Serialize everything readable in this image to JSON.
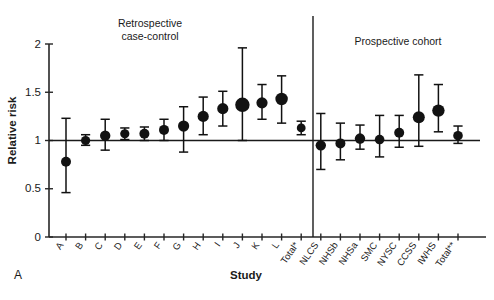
{
  "figure": {
    "panel_letter": "A",
    "axis": {
      "ylabel": "Relative risk",
      "xlabel": "Study",
      "yticks": [
        "0",
        "0.5",
        "1",
        "1.5",
        "2"
      ],
      "ytick_values": [
        0,
        0.5,
        1,
        1.5,
        2
      ],
      "ylim": [
        0,
        2
      ],
      "reference_value": 1
    },
    "groups": [
      {
        "title_line1": "Retrospective",
        "title_line2": "case-control"
      },
      {
        "title_line1": "Prospective cohort",
        "title_line2": ""
      }
    ]
  },
  "chart_data": {
    "type": "scatter",
    "title": "",
    "subtitle": "",
    "xlabel": "Study",
    "ylabel": "Relative risk",
    "ylim": [
      0,
      2
    ],
    "yticks": [
      0,
      0.5,
      1,
      1.5,
      2
    ],
    "grid": false,
    "legend": null,
    "reference_line": 1,
    "annotations": [
      "Retrospective case-control",
      "Prospective cohort"
    ],
    "group_divider_after": "Total*",
    "categories": [
      "A",
      "B",
      "C",
      "D",
      "E",
      "F",
      "G",
      "H",
      "I",
      "J",
      "K",
      "L",
      "Total*",
      "NLCS",
      "NHSb",
      "NHSa",
      "SMC",
      "NYSC",
      "CCSS",
      "IWHS",
      "Total**"
    ],
    "groups": [
      "Retrospective case-control",
      "Retrospective case-control",
      "Retrospective case-control",
      "Retrospective case-control",
      "Retrospective case-control",
      "Retrospective case-control",
      "Retrospective case-control",
      "Retrospective case-control",
      "Retrospective case-control",
      "Retrospective case-control",
      "Retrospective case-control",
      "Retrospective case-control",
      "Retrospective case-control",
      "Prospective cohort",
      "Prospective cohort",
      "Prospective cohort",
      "Prospective cohort",
      "Prospective cohort",
      "Prospective cohort",
      "Prospective cohort",
      "Prospective cohort"
    ],
    "values": [
      0.78,
      1.0,
      1.05,
      1.07,
      1.07,
      1.11,
      1.15,
      1.25,
      1.33,
      1.37,
      1.39,
      1.43,
      1.13,
      0.95,
      0.97,
      1.02,
      1.01,
      1.08,
      1.24,
      1.31,
      1.05
    ],
    "ci_lower": [
      0.46,
      0.95,
      0.9,
      1.01,
      1.0,
      1.0,
      0.88,
      1.06,
      1.15,
      1.0,
      1.22,
      1.18,
      1.06,
      0.7,
      0.8,
      0.91,
      0.83,
      0.93,
      0.94,
      1.09,
      0.97
    ],
    "ci_upper": [
      1.23,
      1.06,
      1.22,
      1.13,
      1.14,
      1.22,
      1.35,
      1.45,
      1.51,
      1.96,
      1.58,
      1.67,
      1.2,
      1.28,
      1.18,
      1.16,
      1.26,
      1.26,
      1.68,
      1.58,
      1.15
    ],
    "marker_sizes": [
      5.0,
      4.6,
      5.2,
      4.6,
      5.0,
      5.0,
      5.6,
      5.6,
      5.6,
      7.2,
      5.6,
      6.2,
      4.4,
      5.2,
      5.0,
      5.2,
      4.8,
      5.0,
      6.0,
      6.2,
      4.8
    ],
    "series": [
      {
        "name": "Relative risk estimate (95% CI)",
        "values": [
          0.78,
          1.0,
          1.05,
          1.07,
          1.07,
          1.11,
          1.15,
          1.25,
          1.33,
          1.37,
          1.39,
          1.43,
          1.13,
          0.95,
          0.97,
          1.02,
          1.01,
          1.08,
          1.24,
          1.31,
          1.05
        ]
      }
    ]
  }
}
